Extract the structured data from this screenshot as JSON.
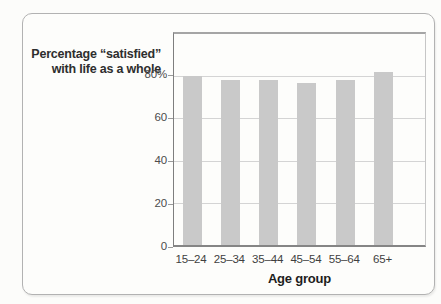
{
  "chart_data": {
    "type": "bar",
    "title_lines": [
      "Percentage “satisfied”",
      "with life as a whole"
    ],
    "categories": [
      "15–24",
      "25–34",
      "35–44",
      "45–54",
      "55–64",
      "65+"
    ],
    "values": [
      80,
      78,
      78,
      77,
      78,
      82
    ],
    "xlabel": "Age group",
    "ylabel": "",
    "ylim": [
      0,
      100
    ],
    "yticks": [
      {
        "value": 80,
        "label": "80%"
      },
      {
        "value": 60,
        "label": "60"
      },
      {
        "value": 40,
        "label": "40"
      },
      {
        "value": 20,
        "label": "20"
      },
      {
        "value": 0,
        "label": "0"
      }
    ],
    "gridlines": [
      20,
      40,
      60,
      80
    ],
    "grid_on": true,
    "legend": null,
    "bar_color": "#c9c9c9",
    "grid_color": "#d4d4d4"
  },
  "colors": {
    "card_background": "#fdfdfb",
    "card_border": "#b2b2b2",
    "axis_dark": "#7e7e7e",
    "title_text": "#2e2e2e"
  }
}
